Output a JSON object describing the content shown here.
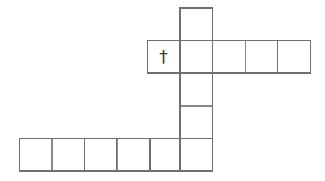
{
  "figure": {
    "kind": "polyomino-net",
    "background_color": "#ffffff",
    "line_color": "#8a8a8a",
    "line_color_dark": "#6f6f6f",
    "line_width": 1.4,
    "cell_size": 32.6,
    "marker_color": "#3a3a3a",
    "canvas": {
      "width": 325,
      "height": 181
    },
    "marker": {
      "glyph": "†",
      "name": "dagger-cross-mark",
      "font_size": 17,
      "cx": 163.5,
      "cy": 56.5
    },
    "groups": [
      {
        "name": "vertical-column",
        "orientation": "vertical",
        "count": 5,
        "x": 180.0,
        "y": 8.0,
        "cells": [
          {
            "x": 180.0,
            "y": 8.0,
            "w": 32.6,
            "h": 32.6
          },
          {
            "x": 180.0,
            "y": 40.6,
            "w": 32.6,
            "h": 32.6
          },
          {
            "x": 180.0,
            "y": 73.2,
            "w": 32.6,
            "h": 32.6
          },
          {
            "x": 180.0,
            "y": 105.8,
            "w": 32.6,
            "h": 32.6
          },
          {
            "x": 180.0,
            "y": 138.4,
            "w": 32.6,
            "h": 32.6
          }
        ]
      },
      {
        "name": "upper-horizontal-row",
        "orientation": "horizontal",
        "count": 5,
        "x": 147.4,
        "y": 40.6,
        "cells": [
          {
            "x": 147.4,
            "y": 40.6,
            "w": 32.6,
            "h": 32.6
          },
          {
            "x": 180.0,
            "y": 40.6,
            "w": 32.6,
            "h": 32.6
          },
          {
            "x": 212.6,
            "y": 40.6,
            "w": 32.6,
            "h": 32.6
          },
          {
            "x": 245.2,
            "y": 40.6,
            "w": 32.6,
            "h": 32.6
          },
          {
            "x": 277.8,
            "y": 40.6,
            "w": 32.6,
            "h": 32.6
          }
        ]
      },
      {
        "name": "lower-horizontal-row",
        "orientation": "horizontal",
        "count": 6,
        "x": 19.4,
        "y": 138.4,
        "cells": [
          {
            "x": 19.4,
            "y": 138.4,
            "w": 32.6,
            "h": 32.6
          },
          {
            "x": 52.0,
            "y": 138.4,
            "w": 32.6,
            "h": 32.6
          },
          {
            "x": 84.6,
            "y": 138.4,
            "w": 32.6,
            "h": 32.6
          },
          {
            "x": 117.2,
            "y": 138.4,
            "w": 32.6,
            "h": 32.6
          },
          {
            "x": 149.8,
            "y": 138.4,
            "w": 32.6,
            "h": 32.6
          },
          {
            "x": 180.0,
            "y": 138.4,
            "w": 32.6,
            "h": 32.6
          }
        ]
      }
    ]
  }
}
